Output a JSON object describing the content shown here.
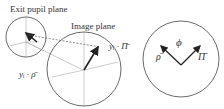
{
  "labels": {
    "exit_pupil_plane": "Exit pupil plane",
    "image_plane": "Image plane",
    "yi_pi": "yᵢ · Π̄",
    "yi_rho": "yᵢ · ρ̄",
    "rho": "ρ̄",
    "pi": "Π̄",
    "phi": "ϕ"
  },
  "colors": {
    "stroke": "#333333",
    "thin": "#777777"
  }
}
